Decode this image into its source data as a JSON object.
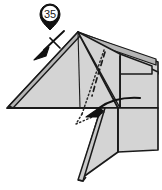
{
  "figure": {
    "kind": "origami-fold-diagram",
    "step_label": "35",
    "width": 162,
    "height": 190,
    "background_color": "#ffffff"
  },
  "colors": {
    "paper_front": "#d4d4d4",
    "paper_shadow": "#b5b5b5",
    "paper_white": "#ffffff",
    "outline": "#1a1a1a",
    "marker_fill": "#111111",
    "marker_text": "#111111",
    "fold_line": "#1a1a1a",
    "hidden_line": "#333333"
  },
  "annotations": {
    "step_marker": {
      "label": "35",
      "shape": "circle-with-pin-pointer",
      "center_x": 50,
      "center_y": 14,
      "radius": 10
    },
    "repeat_arrow": {
      "name": "repeat-fold-arrow",
      "description": "solid arrow pointing down-left with cross tick on shaft",
      "from_x": 62,
      "from_y": 32,
      "to_x": 38,
      "to_y": 56,
      "tick_marks": 1
    },
    "fold_arrow": {
      "name": "valley-fold-curved-arrow",
      "description": "curved arrow sweeping from right to lower-left",
      "from_x": 140,
      "from_y": 98,
      "to_x": 86,
      "to_y": 116
    },
    "hidden_edges": {
      "name": "hidden-edge-dotted",
      "style": "dotted"
    },
    "valley_crease": {
      "name": "valley-crease-dashed",
      "style": "dashed"
    }
  },
  "geometry": {
    "apex_x": 78,
    "apex_y": 32,
    "baseline_y": 108,
    "left_point_x": 7,
    "right_edge_x": 158
  }
}
